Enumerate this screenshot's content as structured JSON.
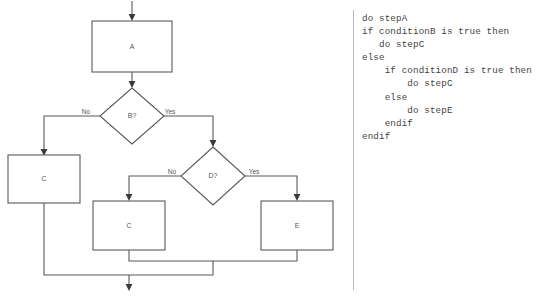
{
  "diagram": {
    "type": "flowchart",
    "colors": {
      "shape_stroke": "#595959",
      "connector_stroke": "#595959",
      "arrowhead_fill": "#3a3a3a",
      "text": "#555555",
      "code_text": "#3f3f3f",
      "divider": "#b9b9b9",
      "background": "#ffffff"
    },
    "nodes": [
      {
        "id": "a",
        "shape": "process",
        "label": "A"
      },
      {
        "id": "b",
        "shape": "decision",
        "label": "B?"
      },
      {
        "id": "c_left",
        "shape": "process",
        "label": "C"
      },
      {
        "id": "d",
        "shape": "decision",
        "label": "D?"
      },
      {
        "id": "c_bottom",
        "shape": "process",
        "label": "C"
      },
      {
        "id": "e",
        "shape": "process",
        "label": "E"
      }
    ],
    "edge_labels": {
      "b_no": "No",
      "b_yes": "Yes",
      "d_no": "No",
      "d_yes": "Yes"
    }
  },
  "code": {
    "language": "pseudocode",
    "lines": [
      "do stepA",
      "if conditionB is true then",
      "   do stepC",
      "else",
      "    if conditionD is true then",
      "        do stepC",
      "    else",
      "        do stepE",
      "    endif",
      "endif"
    ],
    "text": "do stepA\nif conditionB is true then\n   do stepC\nelse\n    if conditionD is true then\n        do stepC\n    else\n        do stepE\n    endif\nendif"
  }
}
